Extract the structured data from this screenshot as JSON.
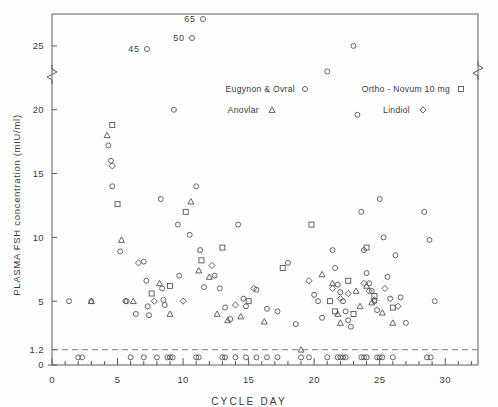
{
  "chart_data": {
    "type": "scatter",
    "title": "",
    "xlabel": "CYCLE DAY",
    "ylabel": "PLASMA  FSH  concentration  (mIU/ml)",
    "xlim": [
      0,
      32.5
    ],
    "ylim": [
      0,
      27.5
    ],
    "xticks": [
      0,
      5,
      10,
      15,
      20,
      25,
      30
    ],
    "xtick_labels": [
      "0",
      "5",
      "10",
      "15",
      "20",
      "25",
      "30"
    ],
    "xtick_minor_step": 1,
    "yticks": [
      0,
      1.2,
      5,
      10,
      15,
      20,
      25
    ],
    "ytick_labels": [
      "0",
      "1.2",
      "5",
      "10",
      "15",
      "20",
      "25"
    ],
    "grid": false,
    "axis_break": true,
    "axis_break_note": "zigzag break on left and right spines above 27.5",
    "reference_line": {
      "y": 1.2,
      "style": "dashed",
      "label": "1.2"
    },
    "legend": {
      "position": "upper-center",
      "entries": [
        {
          "name": "Eugynon & Ovral",
          "marker": "circle"
        },
        {
          "name": "Anovlar",
          "marker": "triangle"
        },
        {
          "name": "Ortho - Novum 10 mg",
          "marker": "square"
        },
        {
          "name": "Lindiol",
          "marker": "diamond"
        }
      ]
    },
    "offscale_annotations": [
      {
        "label": "65",
        "marker": "circle",
        "x_px": 196,
        "y_px": 22
      },
      {
        "label": "50",
        "marker": "circle",
        "x_px": 185,
        "y_px": 41
      },
      {
        "label": "45",
        "marker": "circle",
        "x_px": 140,
        "y_px": 52
      }
    ],
    "series": [
      {
        "name": "Eugynon & Ovral",
        "marker": "circle",
        "points": [
          [
            1.3,
            5.0
          ],
          [
            3.0,
            5.0
          ],
          [
            4.3,
            17.2
          ],
          [
            4.5,
            16.0
          ],
          [
            4.6,
            14.0
          ],
          [
            5.2,
            8.9
          ],
          [
            5.6,
            5.0
          ],
          [
            5.7,
            5.0
          ],
          [
            6.4,
            4.0
          ],
          [
            7.0,
            8.1
          ],
          [
            7.2,
            6.6
          ],
          [
            7.3,
            4.6
          ],
          [
            7.4,
            3.9
          ],
          [
            8.3,
            13.0
          ],
          [
            8.4,
            6.0
          ],
          [
            8.5,
            5.1
          ],
          [
            8.6,
            4.7
          ],
          [
            9.3,
            20.0
          ],
          [
            9.6,
            11.0
          ],
          [
            9.7,
            7.0
          ],
          [
            10.5,
            10.2
          ],
          [
            11.0,
            14.0
          ],
          [
            11.3,
            9.0
          ],
          [
            11.6,
            6.1
          ],
          [
            12.4,
            7.0
          ],
          [
            12.8,
            6.0
          ],
          [
            13.2,
            4.5
          ],
          [
            13.6,
            3.6
          ],
          [
            14.2,
            11.0
          ],
          [
            14.6,
            5.2
          ],
          [
            14.8,
            4.6
          ],
          [
            15.6,
            5.9
          ],
          [
            16.4,
            4.4
          ],
          [
            17.2,
            4.2
          ],
          [
            18.0,
            8.0
          ],
          [
            18.6,
            3.2
          ],
          [
            20.0,
            5.5
          ],
          [
            20.3,
            5.0
          ],
          [
            20.6,
            3.7
          ],
          [
            21.0,
            23.0
          ],
          [
            21.4,
            9.0
          ],
          [
            21.6,
            7.6
          ],
          [
            21.8,
            6.3
          ],
          [
            22.0,
            5.7
          ],
          [
            22.2,
            5.0
          ],
          [
            22.4,
            4.2
          ],
          [
            22.6,
            3.5
          ],
          [
            22.8,
            3.0
          ],
          [
            23.0,
            25.0
          ],
          [
            23.3,
            19.6
          ],
          [
            23.6,
            12.0
          ],
          [
            23.8,
            9.0
          ],
          [
            24.0,
            7.2
          ],
          [
            24.2,
            6.4
          ],
          [
            24.4,
            5.8
          ],
          [
            24.6,
            5.0
          ],
          [
            24.8,
            4.3
          ],
          [
            25.0,
            13.0
          ],
          [
            25.3,
            10.0
          ],
          [
            25.6,
            6.9
          ],
          [
            25.8,
            5.2
          ],
          [
            26.2,
            8.6
          ],
          [
            26.6,
            5.3
          ],
          [
            27.0,
            3.3
          ],
          [
            28.4,
            12.0
          ],
          [
            28.8,
            9.8
          ],
          [
            29.2,
            5.0
          ]
        ]
      },
      {
        "name": "Anovlar",
        "marker": "triangle",
        "points": [
          [
            3.0,
            5.0
          ],
          [
            4.2,
            18.0
          ],
          [
            5.3,
            9.8
          ],
          [
            6.2,
            5.0
          ],
          [
            8.2,
            6.4
          ],
          [
            9.0,
            4.0
          ],
          [
            10.6,
            12.8
          ],
          [
            11.2,
            7.4
          ],
          [
            12.0,
            6.9
          ],
          [
            12.6,
            4.0
          ],
          [
            13.4,
            3.5
          ],
          [
            14.4,
            3.8
          ],
          [
            16.2,
            3.4
          ],
          [
            19.0,
            1.2
          ],
          [
            20.6,
            7.1
          ],
          [
            21.4,
            6.4
          ],
          [
            21.8,
            4.0
          ],
          [
            22.0,
            3.3
          ],
          [
            23.2,
            5.8
          ],
          [
            23.5,
            4.6
          ],
          [
            24.0,
            6.2
          ],
          [
            24.4,
            4.9
          ],
          [
            25.2,
            4.1
          ],
          [
            26.0,
            3.3
          ]
        ]
      },
      {
        "name": "Ortho - Novum 10 mg",
        "marker": "square",
        "points": [
          [
            4.6,
            18.8
          ],
          [
            5.0,
            12.6
          ],
          [
            7.6,
            5.6
          ],
          [
            9.0,
            6.2
          ],
          [
            10.2,
            12.0
          ],
          [
            11.4,
            8.2
          ],
          [
            13.0,
            9.2
          ],
          [
            15.0,
            5.0
          ],
          [
            17.6,
            7.6
          ],
          [
            19.8,
            11.0
          ],
          [
            21.2,
            5.0
          ],
          [
            21.6,
            4.2
          ],
          [
            22.6,
            6.6
          ],
          [
            23.0,
            4.0
          ],
          [
            24.0,
            9.2
          ],
          [
            24.6,
            5.4
          ],
          [
            26.0,
            4.5
          ]
        ]
      },
      {
        "name": "Lindiol",
        "marker": "diamond",
        "points": [
          [
            4.6,
            15.6
          ],
          [
            6.6,
            8.0
          ],
          [
            7.8,
            5.0
          ],
          [
            10.0,
            5.0
          ],
          [
            12.2,
            7.8
          ],
          [
            14.0,
            4.7
          ],
          [
            15.4,
            6.0
          ],
          [
            19.6,
            6.6
          ],
          [
            21.4,
            6.0
          ],
          [
            22.0,
            5.2
          ],
          [
            22.6,
            5.6
          ],
          [
            23.8,
            6.4
          ],
          [
            24.2,
            5.8
          ],
          [
            24.6,
            5.1
          ],
          [
            25.4,
            6.0
          ],
          [
            26.4,
            4.6
          ]
        ]
      }
    ],
    "baseline_points_note": "dense row of markers lying on or just below the 1.2 mIU/ml detection-limit line across days 2-29",
    "baseline_points": [
      [
        2.0,
        0.6
      ],
      [
        2.3,
        0.6
      ],
      [
        6.0,
        0.6
      ],
      [
        7.0,
        0.6
      ],
      [
        8.0,
        0.6
      ],
      [
        8.8,
        0.6
      ],
      [
        9.0,
        0.6
      ],
      [
        9.2,
        0.6
      ],
      [
        11.0,
        0.6
      ],
      [
        11.2,
        0.6
      ],
      [
        13.0,
        0.6
      ],
      [
        13.2,
        0.6
      ],
      [
        14.0,
        0.6
      ],
      [
        14.8,
        0.6
      ],
      [
        15.6,
        0.6
      ],
      [
        16.4,
        0.6
      ],
      [
        17.2,
        0.6
      ],
      [
        19.0,
        0.6
      ],
      [
        19.6,
        0.6
      ],
      [
        21.0,
        0.6
      ],
      [
        21.8,
        0.6
      ],
      [
        22.0,
        0.6
      ],
      [
        22.2,
        0.6
      ],
      [
        22.4,
        0.6
      ],
      [
        23.6,
        0.6
      ],
      [
        23.8,
        0.6
      ],
      [
        24.0,
        0.6
      ],
      [
        24.8,
        0.6
      ],
      [
        25.0,
        0.6
      ],
      [
        25.2,
        0.6
      ],
      [
        26.0,
        0.6
      ],
      [
        28.6,
        0.6
      ],
      [
        28.9,
        0.6
      ]
    ]
  }
}
